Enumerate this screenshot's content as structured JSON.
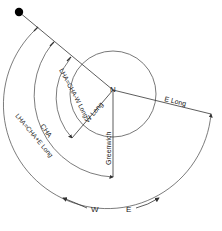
{
  "diagram": {
    "labels": {
      "north": "N",
      "e_long": "E Long",
      "w_long": "W Long",
      "greenwich": "Greenwich",
      "cha": "CHA",
      "lha_west": "LHA=CHA-W Long",
      "lha_east": "LHA=CHA+E Long",
      "west": "W",
      "east": "E"
    },
    "colors": {
      "line": "#333333",
      "star": "#000000",
      "background": "#ffffff"
    }
  }
}
